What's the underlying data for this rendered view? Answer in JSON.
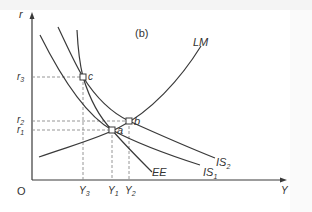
{
  "diagram": {
    "panel_label": "(b)",
    "axes": {
      "y_label": "r",
      "x_label": "Y",
      "origin_label": "O"
    },
    "curves": {
      "lm": {
        "label": "LM"
      },
      "is1": {
        "label": "IS",
        "sub": "1"
      },
      "is2": {
        "label": "IS",
        "sub": "2"
      },
      "ee": {
        "label": "EE"
      }
    },
    "points": {
      "a": {
        "label": "a"
      },
      "b": {
        "label": "b"
      },
      "c": {
        "label": "c"
      }
    },
    "y_ticks": [
      {
        "label": "r",
        "sub": "3"
      },
      {
        "label": "r",
        "sub": "2"
      },
      {
        "label": "r",
        "sub": "1"
      }
    ],
    "x_ticks": [
      {
        "label": "Y",
        "sub": "3"
      },
      {
        "label": "Y",
        "sub": "1"
      },
      {
        "label": "Y",
        "sub": "2"
      }
    ],
    "colors": {
      "line": "#3a3a3a",
      "guide": "#8a8a8a",
      "text": "#333333"
    }
  }
}
